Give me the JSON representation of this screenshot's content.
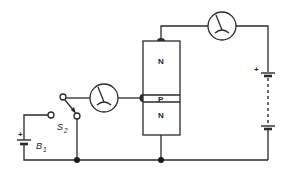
{
  "diagram": {
    "type": "circuit",
    "colors": {
      "line": "#2a2a2a",
      "background": "#ffffff"
    },
    "transistor": {
      "regions": [
        {
          "label": "N",
          "position": "top"
        },
        {
          "label": "P",
          "position": "middle"
        },
        {
          "label": "N",
          "position": "bottom"
        }
      ]
    },
    "meters": [
      {
        "name": "collector-meter",
        "icon": "galvanometer-icon"
      },
      {
        "name": "base-meter",
        "icon": "galvanometer-icon"
      }
    ],
    "switch": {
      "label": "S",
      "subscript": "2"
    },
    "batteries": [
      {
        "label": "B",
        "subscript": "1",
        "polarity_mark": "+"
      },
      {
        "label": "",
        "polarity_mark": "+"
      }
    ]
  }
}
